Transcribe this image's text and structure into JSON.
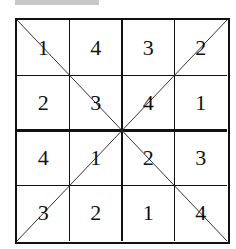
{
  "header": {
    "bar": ""
  },
  "grid": {
    "rows": 4,
    "cols": 4,
    "cells": [
      [
        "1",
        "4",
        "3",
        "2"
      ],
      [
        "2",
        "3",
        "4",
        "1"
      ],
      [
        "4",
        "1",
        "2",
        "3"
      ],
      [
        "3",
        "2",
        "1",
        "4"
      ]
    ],
    "diagonals": [
      "top-left to bottom-right",
      "top-right to bottom-left"
    ]
  }
}
